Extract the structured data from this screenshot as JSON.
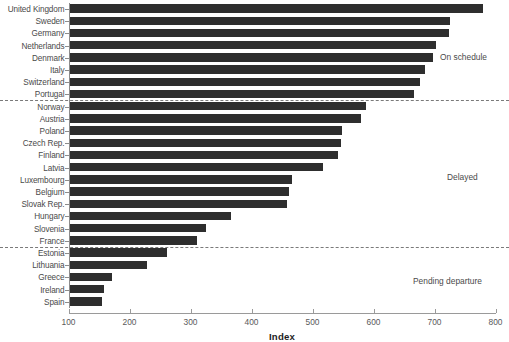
{
  "chart_data": {
    "type": "bar",
    "orientation": "horizontal",
    "title": "",
    "xlabel": "Index",
    "ylabel": "",
    "xlim": [
      100,
      800
    ],
    "xticks": [
      100,
      200,
      300,
      400,
      500,
      600,
      700,
      800
    ],
    "grid": false,
    "legend": "none",
    "bar_color": "#2e2e2e",
    "categories": [
      "United Kingdom",
      "Sweden",
      "Germany",
      "Netherlands",
      "Denmark",
      "Italy",
      "Switzerland",
      "Portugal",
      "Norway",
      "Austria",
      "Poland",
      "Czech Rep.",
      "Finland",
      "Latvia",
      "Luxembourg",
      "Belgium",
      "Slovak Rep.",
      "Hungary",
      "Slovenia",
      "France",
      "Estonia",
      "Lithuania",
      "Greece",
      "Ireland",
      "Spain"
    ],
    "values": [
      780,
      725,
      724,
      702,
      697,
      684,
      677,
      666,
      587,
      579,
      548,
      547,
      541,
      517,
      467,
      461,
      458,
      366,
      325,
      310,
      262,
      229,
      171,
      159,
      155
    ],
    "annotations": [
      {
        "label": "On schedule",
        "group": "on-schedule"
      },
      {
        "label": "Delayed",
        "group": "delayed"
      },
      {
        "label": "Pending departure",
        "group": "pending-departure"
      }
    ],
    "separators": [
      {
        "after_category": "Portugal"
      },
      {
        "after_category": "France"
      }
    ]
  }
}
